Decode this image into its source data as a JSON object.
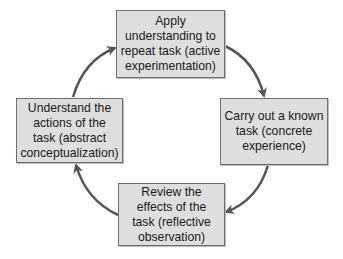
{
  "diagram": {
    "type": "cycle",
    "title": "",
    "colors": {
      "box_fill": "#dedede",
      "box_border": "#6f6f6f",
      "arrow": "#555555",
      "text": "#1a1a1a",
      "background": "#ffffff"
    },
    "nodes": [
      {
        "id": "active-experimentation",
        "position": "top",
        "label": "Apply\nunderstanding to\nrepeat task (active\nexperimentation)"
      },
      {
        "id": "concrete-experience",
        "position": "right",
        "label": "Carry out a known\ntask (concrete\nexperience)"
      },
      {
        "id": "reflective-observation",
        "position": "bottom",
        "label": "Review the\neffects of the\ntask (reflective\nobservation)"
      },
      {
        "id": "abstract-conceptualization",
        "position": "left",
        "label": "Understand the\nactions of the\ntask (abstract\nconceptualization)"
      }
    ],
    "edges": [
      {
        "from": "active-experimentation",
        "to": "concrete-experience",
        "direction": "clockwise"
      },
      {
        "from": "concrete-experience",
        "to": "reflective-observation",
        "direction": "clockwise"
      },
      {
        "from": "reflective-observation",
        "to": "abstract-conceptualization",
        "direction": "clockwise"
      },
      {
        "from": "abstract-conceptualization",
        "to": "active-experimentation",
        "direction": "clockwise"
      }
    ]
  }
}
